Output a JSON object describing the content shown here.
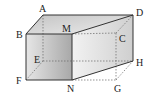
{
  "figure": {
    "vertices": {
      "A": {
        "label": "A",
        "x": 43,
        "y": 15
      },
      "B": {
        "label": "B",
        "x": 26,
        "y": 34
      },
      "M": {
        "label": "M",
        "x": 72,
        "y": 34
      },
      "D": {
        "label": "D",
        "x": 133,
        "y": 15
      },
      "C": {
        "label": "C",
        "x": 116,
        "y": 33
      },
      "E": {
        "label": "E",
        "x": 43,
        "y": 61
      },
      "H": {
        "label": "H",
        "x": 133,
        "y": 61
      },
      "F": {
        "label": "F",
        "x": 26,
        "y": 80
      },
      "N": {
        "label": "N",
        "x": 72,
        "y": 80
      },
      "G": {
        "label": "G",
        "x": 116,
        "y": 80
      }
    },
    "colors": {
      "edge": "#333333",
      "hidden_edge": "#666666",
      "front_face": "#b8b8b8",
      "top_face": "#d6d6d6",
      "side_face": "#e2e2e2"
    }
  }
}
